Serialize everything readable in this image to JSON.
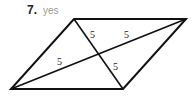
{
  "problem": {
    "number": "7.",
    "answer": "yes"
  },
  "figure": {
    "shape": "parallelogram",
    "vertices": {
      "top_left": [
        74,
        19
      ],
      "top_right": [
        186,
        19
      ],
      "bottom_right": [
        123,
        89
      ],
      "bottom_left": [
        11,
        89
      ]
    },
    "segment_labels": [
      "5",
      "5",
      "5",
      "5"
    ],
    "stroke_color": "#111111"
  }
}
